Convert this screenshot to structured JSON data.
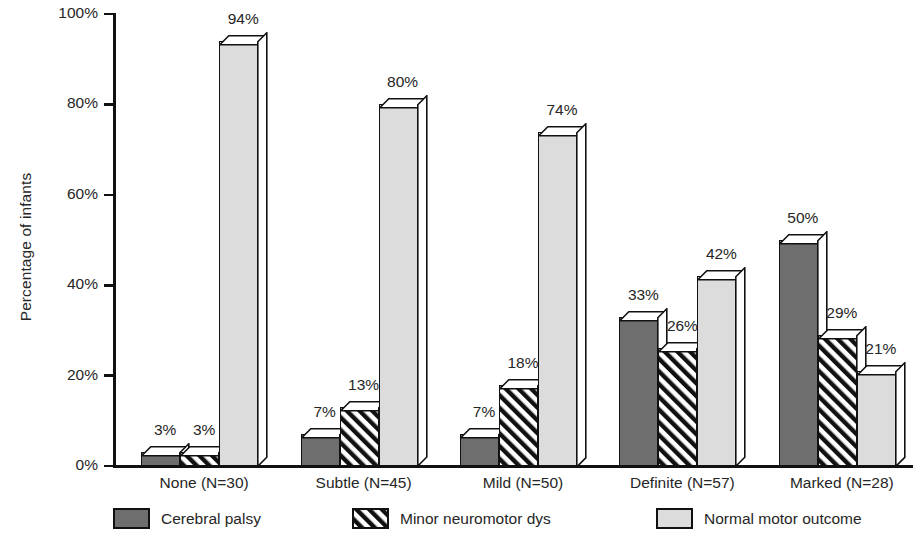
{
  "chart_data": {
    "type": "bar",
    "title": "",
    "subtitle": "",
    "xlabel": "",
    "ylabel": "Percentage of infants",
    "ylim": [
      0,
      100
    ],
    "yticks": [
      "0%",
      "20%",
      "40%",
      "60%",
      "80%",
      "100%"
    ],
    "ytick_values": [
      0,
      20,
      40,
      60,
      80,
      100
    ],
    "grid": false,
    "legend_position": "bottom",
    "value_suffix": "%",
    "categories": [
      "None (N=30)",
      "Subtle (N=45)",
      "Mild (N=50)",
      "Definite (N=57)",
      "Marked (N=28)"
    ],
    "series": [
      {
        "name": "Cerebral palsy",
        "fill": "solid-dark",
        "color": "#6e6e6e",
        "values": [
          3,
          7,
          7,
          33,
          50
        ],
        "labels": [
          "3%",
          "7%",
          "7%",
          "33%",
          "50%"
        ]
      },
      {
        "name": "Minor neuromotor dys",
        "fill": "hatch",
        "color": "#ffffff",
        "values": [
          3,
          13,
          18,
          26,
          29
        ],
        "labels": [
          "3%",
          "13%",
          "18%",
          "26%",
          "29%"
        ]
      },
      {
        "name": "Normal motor outcome",
        "fill": "solid-light",
        "color": "#dcdcdc",
        "values": [
          94,
          80,
          74,
          42,
          21
        ],
        "labels": [
          "94%",
          "80%",
          "74%",
          "42%",
          "21%"
        ]
      }
    ]
  }
}
